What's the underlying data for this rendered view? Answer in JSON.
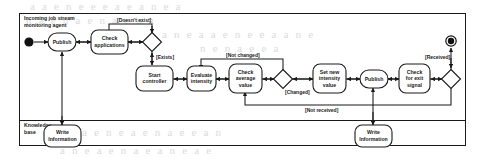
{
  "diagram": {
    "type": "uml-activity-diagram",
    "swimlanes": [
      {
        "id": "agent",
        "label": "Incoming job stream\nmonitoring agent",
        "label_line1": "Incoming job stream",
        "label_line2": "monitoring agent"
      },
      {
        "id": "kb",
        "label": "Knowledge base",
        "label_line1": "Knowledge",
        "label_line2": "base"
      }
    ],
    "nodes": [
      {
        "id": "initial",
        "kind": "initial-node",
        "label": "",
        "lane": "agent"
      },
      {
        "id": "publish1",
        "kind": "action",
        "label": "Publish",
        "lines": [
          "Publish"
        ],
        "lane": "agent"
      },
      {
        "id": "check-applications",
        "kind": "action",
        "label": "Check applications",
        "lines": [
          "Check",
          "applications"
        ],
        "lane": "agent"
      },
      {
        "id": "decision1",
        "kind": "decision",
        "label": "",
        "lane": "agent"
      },
      {
        "id": "start-controller",
        "kind": "action",
        "label": "Start controller",
        "lines": [
          "Start",
          "controller"
        ],
        "lane": "agent"
      },
      {
        "id": "evaluate-intensity",
        "kind": "action",
        "label": "Evaluate intensity",
        "lines": [
          "Evaluate",
          "intensity"
        ],
        "lane": "agent"
      },
      {
        "id": "check-average-value",
        "kind": "action",
        "label": "Check average value",
        "lines": [
          "Check",
          "average",
          "value"
        ],
        "lane": "agent"
      },
      {
        "id": "decision2",
        "kind": "decision",
        "label": "",
        "lane": "agent"
      },
      {
        "id": "set-new-intensity-value",
        "kind": "action",
        "label": "Set new intensity value",
        "lines": [
          "Set new",
          "intensity",
          "value"
        ],
        "lane": "agent"
      },
      {
        "id": "publish2",
        "kind": "action",
        "label": "Publish",
        "lines": [
          "Publish"
        ],
        "lane": "agent"
      },
      {
        "id": "check-for-exit-signal",
        "kind": "action",
        "label": "Check for exit signal",
        "lines": [
          "Check",
          "for exit",
          "signal"
        ],
        "lane": "agent"
      },
      {
        "id": "decision3",
        "kind": "decision",
        "label": "",
        "lane": "agent"
      },
      {
        "id": "final",
        "kind": "final-node",
        "label": "",
        "lane": "agent"
      },
      {
        "id": "write-information-1",
        "kind": "action",
        "label": "Write information",
        "lines": [
          "Write",
          "Information"
        ],
        "lane": "kb"
      },
      {
        "id": "write-information-2",
        "kind": "action",
        "label": "Write information",
        "lines": [
          "Write",
          "Information"
        ],
        "lane": "kb"
      }
    ],
    "guards": [
      {
        "id": "guard-doesnt-exist",
        "text": "[Doesn't exist]",
        "from": "decision1",
        "to": "check-applications"
      },
      {
        "id": "guard-exists",
        "text": "[Exists]",
        "from": "decision1",
        "to": "start-controller"
      },
      {
        "id": "guard-not-changed",
        "text": "[Not changed]",
        "from": "decision2",
        "to": "evaluate-intensity"
      },
      {
        "id": "guard-changed",
        "text": "[Changed]",
        "from": "decision2",
        "to": "set-new-intensity-value"
      },
      {
        "id": "guard-received",
        "text": "[Received]",
        "from": "decision3",
        "to": "final"
      },
      {
        "id": "guard-not-received",
        "text": "[Not received]",
        "from": "decision3",
        "to": "check-average-value"
      }
    ],
    "edges": [
      {
        "from": "initial",
        "to": "publish1"
      },
      {
        "from": "publish1",
        "to": "check-applications"
      },
      {
        "from": "check-applications",
        "to": "decision1"
      },
      {
        "from": "decision1",
        "to": "check-applications",
        "guard": "[Doesn't exist]"
      },
      {
        "from": "decision1",
        "to": "start-controller",
        "guard": "[Exists]"
      },
      {
        "from": "start-controller",
        "to": "evaluate-intensity"
      },
      {
        "from": "evaluate-intensity",
        "to": "check-average-value"
      },
      {
        "from": "check-average-value",
        "to": "decision2"
      },
      {
        "from": "decision2",
        "to": "evaluate-intensity",
        "guard": "[Not changed]"
      },
      {
        "from": "decision2",
        "to": "set-new-intensity-value",
        "guard": "[Changed]"
      },
      {
        "from": "set-new-intensity-value",
        "to": "publish2"
      },
      {
        "from": "publish2",
        "to": "check-for-exit-signal"
      },
      {
        "from": "check-for-exit-signal",
        "to": "decision3"
      },
      {
        "from": "decision3",
        "to": "final",
        "guard": "[Received]"
      },
      {
        "from": "decision3",
        "to": "check-average-value",
        "guard": "[Not received]"
      },
      {
        "from": "write-information-1",
        "to": "publish1"
      },
      {
        "from": "write-information-2",
        "to": "publish2"
      }
    ],
    "colors": {
      "stroke": "#1a1a1a",
      "fill": "#ffffff",
      "background": "#ffffff",
      "ghost_text": "#cfcfcf"
    }
  },
  "ghost_text": {
    "lines": [
      {
        "text": "a   a  e n e   e       e   a e      a  n e  a",
        "x": 30,
        "y": 4
      },
      {
        "text": "n a    e    n   a  e       n     a  e   n   a",
        "x": 26,
        "y": 18
      },
      {
        "text": "e  a  n   e  a  a  e n    e   e  a   a n e",
        "x": 150,
        "y": 32
      },
      {
        "text": "n   e      n  a e  e   a",
        "x": 200,
        "y": 46
      },
      {
        "text": "e  a   e  n e      a e     n    a  e    e  a n",
        "x": 70,
        "y": 128
      },
      {
        "text": "a  n  e   a   e    n  a   e   a  n e    a  e",
        "x": 60,
        "y": 146
      }
    ]
  }
}
